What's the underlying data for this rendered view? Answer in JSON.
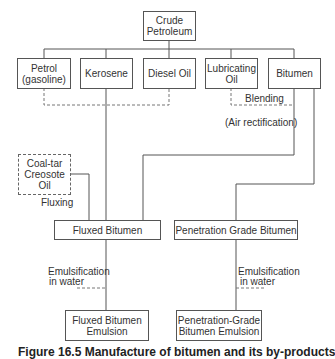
{
  "diagram": {
    "nodes": {
      "crude": "Crude\nPetroleum",
      "petrol": "Petrol\n(gasoline)",
      "kerosene": "Kerosene",
      "diesel": "Diesel Oil",
      "lubricating": "Lubricating\nOil",
      "bitumen": "Bitumen",
      "coaltar": "Coal-tar\nCreosote\nOil",
      "fluxed": "Fluxed Bitumen",
      "penetration": "Penetration Grade Bitumen",
      "fluxed_emulsion": "Fluxed Bitumen\nEmulsion",
      "penetration_emulsion": "Penetration-Grade\nBitumen Emulsion"
    },
    "labels": {
      "blending": "Blending",
      "air_rectification": "(Air rectification)",
      "fluxing": "Fluxing",
      "emulsification_left_1": "Emulsification",
      "emulsification_left_2": "in water",
      "emulsification_right_1": "Emulsification",
      "emulsification_right_2": "in water"
    },
    "caption": "Figure 16.5 Manufacture of bitumen and its by-products"
  }
}
